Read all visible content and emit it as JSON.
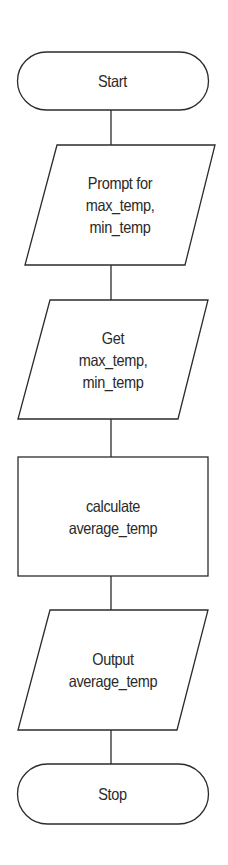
{
  "diagram": {
    "type": "flowchart",
    "direction": "top-to-bottom",
    "colors": {
      "stroke": "#2b2b2b",
      "fill": "#ffffff",
      "text": "#2a2a2a",
      "background": "#ffffff"
    },
    "nodes": [
      {
        "id": "start",
        "shape": "terminator",
        "lines": [
          "Start"
        ]
      },
      {
        "id": "prompt",
        "shape": "parallelogram",
        "role": "input/output",
        "lines": [
          "Prompt for",
          "max_temp,",
          "min_temp"
        ]
      },
      {
        "id": "get",
        "shape": "parallelogram",
        "role": "input/output",
        "lines": [
          "Get",
          "max_temp,",
          "min_temp"
        ]
      },
      {
        "id": "calculate",
        "shape": "rectangle",
        "role": "process",
        "lines": [
          "calculate",
          "average_temp"
        ]
      },
      {
        "id": "output",
        "shape": "parallelogram",
        "role": "input/output",
        "lines": [
          "Output",
          "average_temp"
        ]
      },
      {
        "id": "stop",
        "shape": "terminator",
        "lines": [
          "Stop"
        ]
      }
    ],
    "edges": [
      {
        "from": "start",
        "to": "prompt"
      },
      {
        "from": "prompt",
        "to": "get"
      },
      {
        "from": "get",
        "to": "calculate"
      },
      {
        "from": "calculate",
        "to": "output"
      },
      {
        "from": "output",
        "to": "stop"
      }
    ]
  }
}
